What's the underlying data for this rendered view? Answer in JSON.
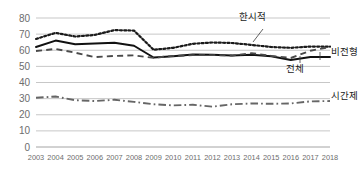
{
  "chart_data": {
    "type": "line",
    "title": "",
    "xlabel": "",
    "ylabel": "",
    "ylim": [
      0,
      80
    ],
    "ytick_values": [
      0,
      10,
      20,
      30,
      40,
      50,
      60,
      70,
      80
    ],
    "grid": true,
    "legend_position": "inline-annotations",
    "categories": [
      "2003",
      "2004",
      "2005",
      "2006",
      "2007",
      "2008",
      "2009",
      "2010",
      "2011",
      "2012",
      "2013",
      "2014",
      "2015",
      "2016",
      "2017",
      "2018"
    ],
    "series": [
      {
        "name": "한시적",
        "style": "dotted",
        "color": "#1a1a1a",
        "values": [
          67.0,
          70.8,
          68.5,
          69.5,
          72.5,
          72.2,
          60.3,
          61.5,
          64.0,
          64.8,
          64.5,
          63.3,
          62.0,
          61.5,
          62.3,
          62.2
        ]
      },
      {
        "name": "전체",
        "style": "solid",
        "color": "#111111",
        "values": [
          62.0,
          66.0,
          63.7,
          64.2,
          64.7,
          62.8,
          55.5,
          56.3,
          57.3,
          57.2,
          56.8,
          57.2,
          56.3,
          54.0,
          55.8,
          55.8
        ]
      },
      {
        "name": "비전형",
        "style": "dashed",
        "color": "#4a4a4a",
        "values": [
          59.5,
          60.8,
          58.5,
          55.7,
          56.5,
          56.8,
          55.3,
          56.5,
          57.0,
          57.0,
          56.7,
          58.2,
          56.5,
          55.2,
          59.7,
          62.0
        ]
      },
      {
        "name": "시간제",
        "style": "dashdot",
        "color": "#666666",
        "values": [
          30.5,
          31.3,
          29.0,
          28.5,
          29.3,
          28.0,
          26.5,
          25.8,
          26.2,
          25.0,
          26.5,
          27.0,
          26.8,
          27.0,
          28.3,
          28.5
        ]
      }
    ]
  },
  "annotations": [
    {
      "name": "한시적",
      "text": "한시적"
    },
    {
      "name": "비전형",
      "text": "비전형"
    },
    {
      "name": "전체",
      "text": "전체"
    },
    {
      "name": "시간제",
      "text": "시간제"
    }
  ]
}
